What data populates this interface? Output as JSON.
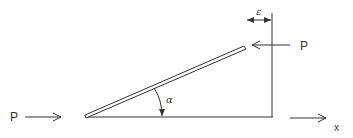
{
  "diagram": {
    "type": "mechanics-free-body",
    "labels": {
      "force_left": "P",
      "force_right": "P",
      "gap": "ε",
      "angle": "α",
      "axis": "x"
    },
    "colors": {
      "stroke": "#333333",
      "background": "#ffffff"
    },
    "geometry": {
      "baseline_y": 117,
      "wall_x": 272,
      "wall_top_y": 13,
      "bar_start": [
        85,
        116
      ],
      "bar_end": [
        245,
        48
      ]
    }
  }
}
